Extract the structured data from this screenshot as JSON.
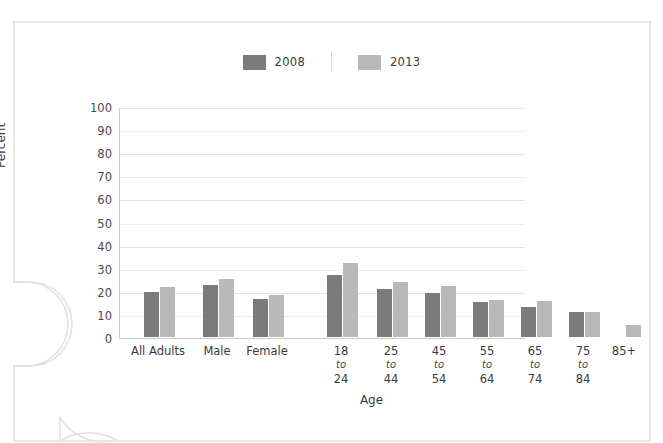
{
  "chart_data": {
    "type": "bar",
    "title": "",
    "xlabel": "Age",
    "ylabel": "Percent",
    "ylim": [
      0,
      100
    ],
    "yticks": [
      100,
      90,
      80,
      70,
      60,
      50,
      40,
      30,
      20,
      10,
      0
    ],
    "grid": true,
    "legend_position": "top-center",
    "categories": [
      "All Adults",
      "Male",
      "Female",
      "18 to 24",
      "25 to 44",
      "45 to 54",
      "55 to 64",
      "65 to 74",
      "75 to 84",
      "85+"
    ],
    "category_labels": [
      {
        "line1": "All Adults",
        "to": "",
        "line3": ""
      },
      {
        "line1": "Male",
        "to": "",
        "line3": ""
      },
      {
        "line1": "Female",
        "to": "",
        "line3": ""
      },
      {
        "line1": "18",
        "to": "to",
        "line3": "24"
      },
      {
        "line1": "25",
        "to": "to",
        "line3": "44"
      },
      {
        "line1": "45",
        "to": "to",
        "line3": "54"
      },
      {
        "line1": "55",
        "to": "to",
        "line3": "64"
      },
      {
        "line1": "65",
        "to": "to",
        "line3": "74"
      },
      {
        "line1": "75",
        "to": "to",
        "line3": "84"
      },
      {
        "line1": "85+",
        "to": "",
        "line3": ""
      }
    ],
    "series": [
      {
        "name": "2008",
        "color": "#7b7b7b",
        "values": [
          19.5,
          22.5,
          16.5,
          27,
          21,
          19,
          15,
          13,
          11,
          null
        ]
      },
      {
        "name": "2013",
        "color": "#b9b9b9",
        "values": [
          21.5,
          25,
          18,
          32,
          24,
          22,
          16,
          15.5,
          11,
          5
        ]
      }
    ]
  },
  "legend": {
    "entries": [
      {
        "label": "2008",
        "color": "#7b7b7b"
      },
      {
        "label": "2013",
        "color": "#b9b9b9"
      }
    ]
  },
  "axes": {
    "y_title": "Percent",
    "x_title": "Age"
  },
  "colors": {
    "series_2008": "#7b7b7b",
    "series_2013": "#b9b9b9",
    "axis": "#c9c9c9",
    "gridline": "#eeeeee",
    "text": "#3a3a3a",
    "page_border": "#e0e0e0"
  }
}
